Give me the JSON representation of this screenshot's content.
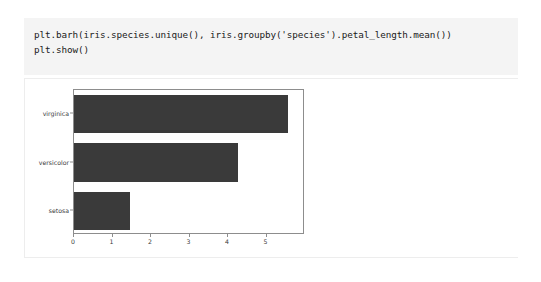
{
  "notebook": {
    "code_cell": {
      "lines": [
        "plt.barh(iris.species.unique(), iris.groupby('species').petal_length.mean())",
        "plt.show()"
      ],
      "background_color": "#f4f4f4"
    },
    "output_cell": {
      "background_color": "#ffffff",
      "border_color": "#ededed"
    }
  },
  "chart_data": {
    "type": "bar",
    "orientation": "horizontal",
    "title": "",
    "xlabel": "",
    "ylabel": "",
    "categories": [
      "setosa",
      "versicolor",
      "virginica"
    ],
    "values": [
      1.46,
      4.26,
      5.55
    ],
    "series": [
      {
        "name": "petal_length mean",
        "values": [
          1.46,
          4.26,
          5.55
        ]
      }
    ],
    "xlim": [
      0,
      6.0
    ],
    "xticks": [
      0,
      1,
      2,
      3,
      4,
      5
    ],
    "xtick_labels": [
      "0",
      "1",
      "2",
      "3",
      "4",
      "5"
    ],
    "ytick_labels": [
      "setosa",
      "versicolor",
      "virginica"
    ],
    "grid": false,
    "legend": false,
    "bar_color": "#3a3a3a",
    "axes_color": "#8d8d8d",
    "tick_label_color": "#3b3b3b",
    "plot_background": "#ffffff"
  }
}
